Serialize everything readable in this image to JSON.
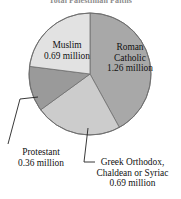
{
  "chart_data": {
    "type": "pie",
    "title": "Total Palestinian Faiths",
    "unit": "million",
    "total": 3.0,
    "categories": [
      "Roman Catholic",
      "Greek Orthodox, Chaldean or Syriac",
      "Protestant",
      "Muslim"
    ],
    "values": [
      1.26,
      0.69,
      0.36,
      0.69
    ],
    "value_labels": [
      "1.26 million",
      "0.69 million",
      "0.36 million",
      "0.69 million"
    ],
    "slice_colors": [
      "#a8a8a8",
      "#cccccc",
      "#9a9a9a",
      "#e2e2e2"
    ],
    "start_angle_deg": 0,
    "direction": "clockwise",
    "legend": "none",
    "grid": false,
    "slices": [
      {
        "label": "Roman Catholic",
        "value": 1.26,
        "value_text": "1.26 million",
        "color": "#a8a8a8",
        "percent": 42.0
      },
      {
        "label": "Greek Orthodox, Chaldean or Syriac",
        "value": 0.69,
        "value_text": "0.69 million",
        "color": "#cccccc",
        "percent": 23.0
      },
      {
        "label": "Protestant",
        "value": 0.36,
        "value_text": "0.36 million",
        "color": "#9a9a9a",
        "percent": 12.0
      },
      {
        "label": "Muslim",
        "value": 0.69,
        "value_text": "0.69 million",
        "color": "#e2e2e2",
        "percent": 23.0
      }
    ]
  },
  "chart": {
    "title": "Total Palestinian Faiths",
    "outline_color": "#6f6f6f",
    "leader_color": "#222222"
  },
  "labels": {
    "muslim": {
      "name": "Muslim",
      "value": "0.69 million"
    },
    "roman": {
      "line1": "Roman",
      "line2": "Catholic",
      "value": "1.26 million"
    },
    "protestant": {
      "name": "Protestant",
      "value": "0.36 million"
    },
    "greek": {
      "line1": "Greek Orthodox,",
      "line2": "Chaldean or Syriac",
      "value": "0.69 million"
    }
  }
}
